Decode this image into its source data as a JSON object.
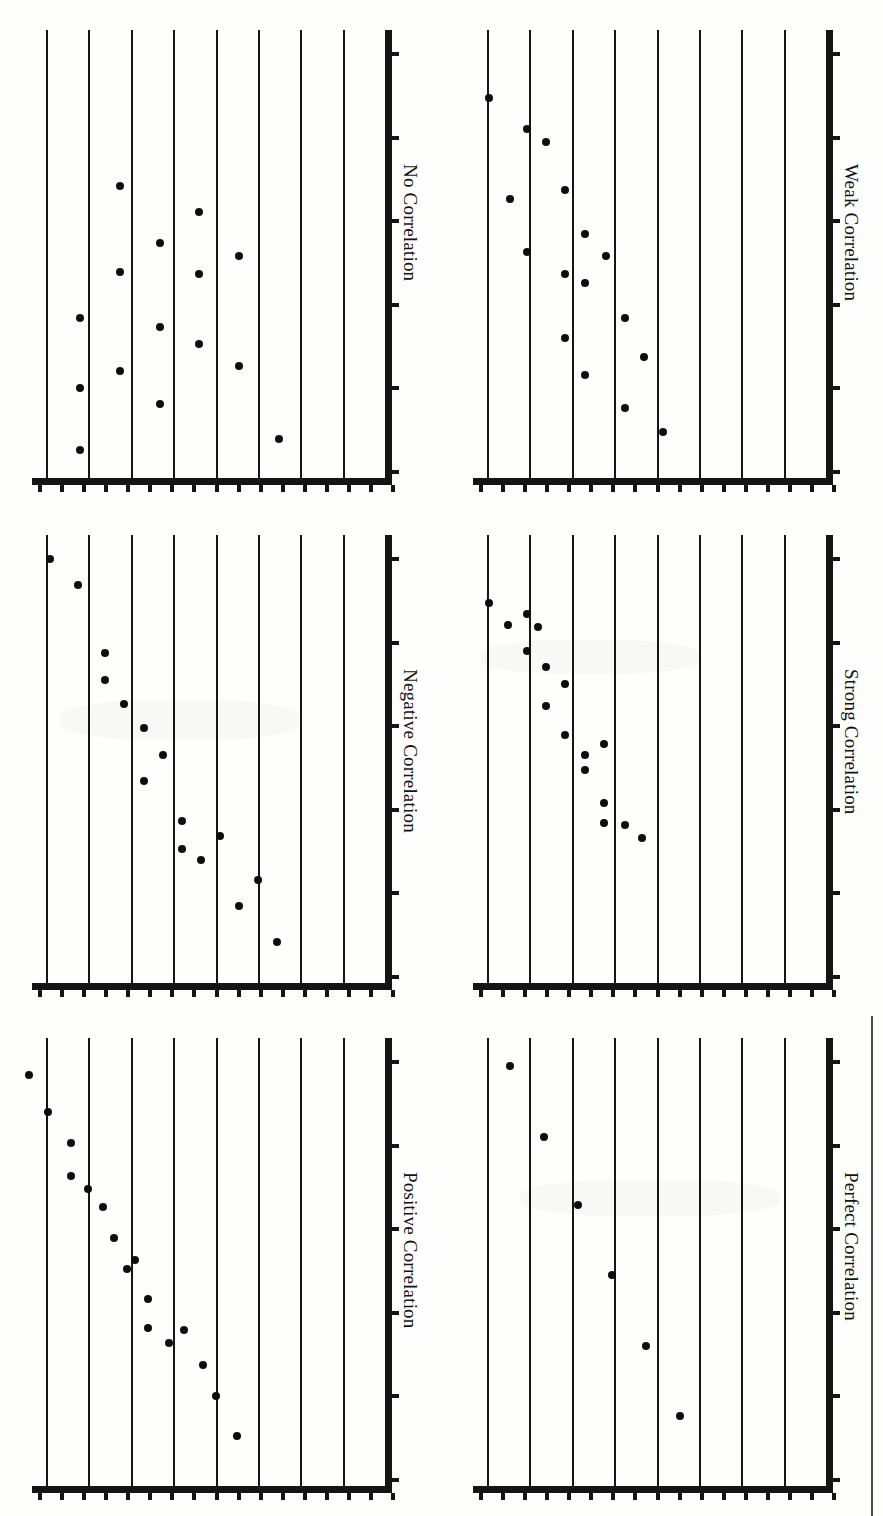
{
  "figure": {
    "kind": "scan-of-printed-figure",
    "orientation_degrees": 90,
    "panel_count": 6,
    "ink_color": "#141414",
    "paper_color": "#fefefd"
  },
  "panels": [
    {
      "id": "no-correlation",
      "title": "No Correlation"
    },
    {
      "id": "weak-correlation",
      "title": "Weak Correlation"
    },
    {
      "id": "negative-correlation",
      "title": "Negative Correlation"
    },
    {
      "id": "strong-correlation",
      "title": "Strong Correlation"
    },
    {
      "id": "positive-correlation",
      "title": "Positive Correlation"
    },
    {
      "id": "perfect-correlation",
      "title": "Perfect Correlation"
    }
  ],
  "chart_data": [
    {
      "type": "scatter",
      "title": "No Correlation",
      "xlabel": "",
      "ylabel": "",
      "xlim": [
        0,
        8
      ],
      "ylim": [
        0,
        10
      ],
      "grid": true,
      "gridlines_x": 8,
      "x_ticks": 17,
      "y_ticks": 6,
      "points": [
        {
          "x": 0.8,
          "y": 3.55
        },
        {
          "x": 0.8,
          "y": 1.95
        },
        {
          "x": 0.8,
          "y": 0.55
        },
        {
          "x": 1.75,
          "y": 6.55
        },
        {
          "x": 1.75,
          "y": 4.6
        },
        {
          "x": 1.75,
          "y": 2.35
        },
        {
          "x": 2.7,
          "y": 5.25
        },
        {
          "x": 2.7,
          "y": 3.35
        },
        {
          "x": 2.7,
          "y": 1.6
        },
        {
          "x": 3.6,
          "y": 5.95
        },
        {
          "x": 3.6,
          "y": 4.55
        },
        {
          "x": 3.6,
          "y": 2.95
        },
        {
          "x": 4.55,
          "y": 4.95
        },
        {
          "x": 4.55,
          "y": 2.45
        },
        {
          "x": 5.5,
          "y": 0.8
        }
      ]
    },
    {
      "type": "scatter",
      "title": "Weak Correlation",
      "xlabel": "",
      "ylabel": "",
      "xlim": [
        0,
        8
      ],
      "ylim": [
        0,
        10
      ],
      "grid": true,
      "gridlines_x": 8,
      "x_ticks": 17,
      "y_ticks": 6,
      "points": [
        {
          "x": 0.05,
          "y": 8.55
        },
        {
          "x": 0.55,
          "y": 6.25
        },
        {
          "x": 0.95,
          "y": 7.85
        },
        {
          "x": 0.95,
          "y": 5.05
        },
        {
          "x": 1.4,
          "y": 7.55
        },
        {
          "x": 1.85,
          "y": 6.45
        },
        {
          "x": 1.85,
          "y": 4.55
        },
        {
          "x": 1.85,
          "y": 3.1
        },
        {
          "x": 2.3,
          "y": 5.45
        },
        {
          "x": 2.3,
          "y": 4.35
        },
        {
          "x": 2.3,
          "y": 2.25
        },
        {
          "x": 2.8,
          "y": 4.95
        },
        {
          "x": 3.25,
          "y": 3.55
        },
        {
          "x": 3.25,
          "y": 1.5
        },
        {
          "x": 3.7,
          "y": 2.65
        },
        {
          "x": 4.15,
          "y": 0.95
        }
      ]
    },
    {
      "type": "scatter",
      "title": "Negative Correlation",
      "xlabel": "",
      "ylabel": "",
      "xlim": [
        0,
        8
      ],
      "ylim": [
        0,
        10
      ],
      "grid": true,
      "gridlines_x": 8,
      "x_ticks": 17,
      "y_ticks": 6,
      "points": [
        {
          "x": 0.1,
          "y": 9.55
        },
        {
          "x": 0.75,
          "y": 8.95
        },
        {
          "x": 1.4,
          "y": 7.4
        },
        {
          "x": 1.4,
          "y": 6.8
        },
        {
          "x": 1.85,
          "y": 6.25
        },
        {
          "x": 2.3,
          "y": 5.7
        },
        {
          "x": 2.3,
          "y": 4.5
        },
        {
          "x": 2.75,
          "y": 5.1
        },
        {
          "x": 3.2,
          "y": 3.6
        },
        {
          "x": 3.2,
          "y": 2.95
        },
        {
          "x": 3.65,
          "y": 2.7
        },
        {
          "x": 4.1,
          "y": 3.25
        },
        {
          "x": 4.55,
          "y": 1.65
        },
        {
          "x": 5.0,
          "y": 2.25
        },
        {
          "x": 5.45,
          "y": 0.85
        }
      ]
    },
    {
      "type": "scatter",
      "title": "Strong Correlation",
      "xlabel": "",
      "ylabel": "",
      "xlim": [
        0,
        8
      ],
      "ylim": [
        0,
        10
      ],
      "grid": true,
      "gridlines_x": 8,
      "x_ticks": 17,
      "y_ticks": 6,
      "points": [
        {
          "x": 0.05,
          "y": 8.55
        },
        {
          "x": 0.5,
          "y": 8.05
        },
        {
          "x": 0.95,
          "y": 8.3
        },
        {
          "x": 0.95,
          "y": 7.45
        },
        {
          "x": 1.2,
          "y": 8.0
        },
        {
          "x": 1.4,
          "y": 7.1
        },
        {
          "x": 1.4,
          "y": 6.2
        },
        {
          "x": 1.85,
          "y": 6.7
        },
        {
          "x": 1.85,
          "y": 5.55
        },
        {
          "x": 2.3,
          "y": 5.1
        },
        {
          "x": 2.3,
          "y": 4.75
        },
        {
          "x": 2.75,
          "y": 5.35
        },
        {
          "x": 2.75,
          "y": 4.0
        },
        {
          "x": 2.75,
          "y": 3.55
        },
        {
          "x": 3.25,
          "y": 3.5
        },
        {
          "x": 3.65,
          "y": 3.2
        }
      ]
    },
    {
      "type": "scatter",
      "title": "Positive Correlation",
      "xlabel": "",
      "ylabel": "",
      "xlim": [
        0,
        8
      ],
      "ylim": [
        0,
        10
      ],
      "grid": true,
      "gridlines_x": 8,
      "x_ticks": 17,
      "y_ticks": 6,
      "points": [
        {
          "x": -0.4,
          "y": 9.25
        },
        {
          "x": 0.05,
          "y": 8.4
        },
        {
          "x": 0.6,
          "y": 7.7
        },
        {
          "x": 0.6,
          "y": 6.95
        },
        {
          "x": 1.0,
          "y": 6.65
        },
        {
          "x": 1.35,
          "y": 6.25
        },
        {
          "x": 1.6,
          "y": 5.55
        },
        {
          "x": 1.9,
          "y": 4.85
        },
        {
          "x": 2.1,
          "y": 5.05
        },
        {
          "x": 2.4,
          "y": 4.15
        },
        {
          "x": 2.4,
          "y": 3.5
        },
        {
          "x": 2.9,
          "y": 3.15
        },
        {
          "x": 3.25,
          "y": 3.45
        },
        {
          "x": 3.7,
          "y": 2.65
        },
        {
          "x": 4.0,
          "y": 1.95
        },
        {
          "x": 4.5,
          "y": 1.05
        }
      ]
    },
    {
      "type": "scatter",
      "title": "Perfect Correlation",
      "xlabel": "",
      "ylabel": "",
      "xlim": [
        0,
        8
      ],
      "ylim": [
        0,
        10
      ],
      "grid": true,
      "gridlines_x": 8,
      "x_ticks": 17,
      "y_ticks": 6,
      "points": [
        {
          "x": 0.55,
          "y": 9.45
        },
        {
          "x": 1.35,
          "y": 7.85
        },
        {
          "x": 2.15,
          "y": 6.3
        },
        {
          "x": 2.95,
          "y": 4.7
        },
        {
          "x": 3.75,
          "y": 3.1
        },
        {
          "x": 4.55,
          "y": 1.5
        }
      ]
    }
  ]
}
